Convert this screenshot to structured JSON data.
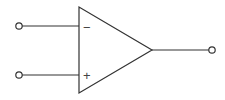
{
  "diagram": {
    "type": "op-amp-symbol",
    "stroke_color": "#333333",
    "inputs": [
      {
        "name": "inverting",
        "sign": "−",
        "y": 26
      },
      {
        "name": "non-inverting",
        "sign": "+",
        "y": 75
      }
    ],
    "output": {
      "name": "output",
      "y": 50
    }
  }
}
